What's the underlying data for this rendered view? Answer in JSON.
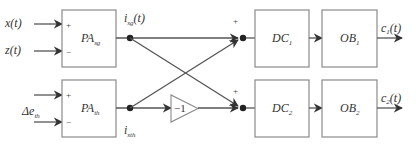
{
  "diagram": {
    "inputs": {
      "x": "x(t)",
      "z": "z(t)",
      "delta_e_main": "Δe",
      "delta_e_sub": "th"
    },
    "blocks": {
      "pa_sg": {
        "main": "PA",
        "sub": "sg"
      },
      "pa_th": {
        "main": "PA",
        "sub": "th"
      },
      "dc1": {
        "main": "DC",
        "sub": "1"
      },
      "dc2": {
        "main": "DC",
        "sub": "2"
      },
      "ob1": {
        "main": "OB",
        "sub": "1"
      },
      "ob2": {
        "main": "OB",
        "sub": "2"
      }
    },
    "signals": {
      "i_sg_main": "i",
      "i_sg_sub": "sg",
      "i_sg_arg": "(t)",
      "i_sth_main": "i",
      "i_sth_sub": "sth"
    },
    "gain": "−1",
    "signs": {
      "plus": "+",
      "minus": "−"
    },
    "outputs": {
      "c1_main": "c",
      "c1_sub": "1",
      "c1_arg": "(t)",
      "c2_main": "c",
      "c2_sub": "2",
      "c2_arg": "(t)"
    },
    "colors": {
      "line": "#555555",
      "box_border": "#8a8a8a",
      "text": "#333333"
    }
  }
}
